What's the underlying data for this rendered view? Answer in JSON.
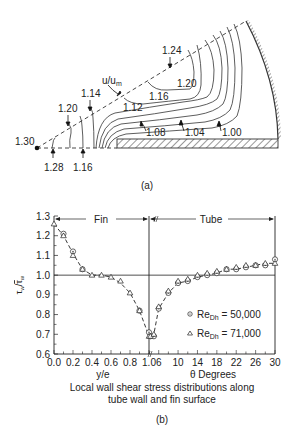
{
  "figure_a": {
    "caption": "(a)",
    "variable_label": "u/u",
    "variable_label_sub": "m",
    "contour_labels": {
      "c124": "1.24",
      "c120_top": "1.20",
      "c116_top": "1.16",
      "c112": "1.12",
      "c108": "1.08",
      "c104": "1.04",
      "c100": "1.00",
      "c130": "1.30",
      "c120_left": "1.20",
      "c114": "1.14",
      "c128": "1.28",
      "c116_bottom": "1.16"
    }
  },
  "figure_b": {
    "caption": "(b)",
    "description_line1": "Local wall shear stress distributions along",
    "description_line2": "tube wall and fin surface"
  },
  "chart_data": {
    "type": "scatter",
    "ylabel": "τw/τ̄w",
    "ylabel_main": "τ",
    "ylabel_sub": "w",
    "ylabel_sep": "/",
    "ylabel_bar": "τ",
    "ylabel_bar_sub": "w",
    "ylim": [
      0.6,
      1.3
    ],
    "yticks": [
      0.6,
      0.7,
      0.8,
      0.9,
      1.0,
      1.1,
      1.2,
      1.3
    ],
    "ytick_labels": [
      "0.6",
      "0.7",
      "0.8",
      "0.9",
      "1.0",
      "1.1",
      "1.2",
      "1.3"
    ],
    "reference_line": 1.0,
    "regions": {
      "fin": {
        "label": "Fin",
        "xlabel": "y/e",
        "xlim": [
          0.0,
          1.0
        ],
        "xticks": [
          0.0,
          0.2,
          0.4,
          0.6,
          0.8,
          1.0
        ],
        "xtick_labels": [
          "0.0",
          "0.2",
          "0.4",
          "0.6",
          "0.8",
          "1.0"
        ],
        "minor_step": 0.1
      },
      "tube": {
        "label": "Tube",
        "xlabel": "θ Degrees",
        "xlim": [
          4,
          30
        ],
        "xticks": [
          6,
          10,
          14,
          18,
          22,
          26,
          30
        ],
        "xtick_labels": [
          "6",
          "10",
          "14",
          "18",
          "22",
          "26",
          "30"
        ],
        "minor_step": 2
      }
    },
    "series": [
      {
        "name": "ReDh = 50,000",
        "name_main": "Re",
        "name_sub": "Dh",
        "name_value": " = 50,000",
        "marker": "circle-dot",
        "fin": {
          "x": [
            0.1,
            0.2,
            0.3,
            0.9,
            1.0
          ],
          "y": [
            1.21,
            1.12,
            1.03,
            0.82,
            0.71
          ]
        },
        "tube": {
          "x": [
            4.3,
            5,
            6,
            8,
            10,
            12,
            14,
            16,
            18,
            20,
            22,
            24,
            26,
            28,
            30
          ],
          "y": [
            0.69,
            0.69,
            0.83,
            0.91,
            0.96,
            0.97,
            0.99,
            1.0,
            1.01,
            1.03,
            1.03,
            1.04,
            1.05,
            1.05,
            1.08
          ]
        }
      },
      {
        "name": "ReDh = 71,000",
        "name_main": "Re",
        "name_sub": "Dh",
        "name_value": " = 71,000",
        "marker": "triangle",
        "fin": {
          "x": [
            0.0,
            0.1,
            0.2,
            0.3,
            0.4,
            0.5,
            0.6,
            0.7,
            0.8,
            0.9,
            1.0
          ],
          "y": [
            1.26,
            1.2,
            1.1,
            1.03,
            1.0,
            1.0,
            0.99,
            0.97,
            0.91,
            0.82,
            0.69
          ]
        },
        "tube": {
          "x": [
            4.3,
            5,
            6,
            8,
            10,
            12,
            14,
            16,
            18,
            20,
            22,
            24,
            26,
            28,
            30
          ],
          "y": [
            0.69,
            0.7,
            0.84,
            0.92,
            0.97,
            0.98,
            1.0,
            1.01,
            1.02,
            1.03,
            1.04,
            1.05,
            1.05,
            1.06,
            1.06
          ]
        }
      }
    ],
    "trend": {
      "fin": {
        "x": [
          0.0,
          0.1,
          0.2,
          0.3,
          0.4,
          0.5,
          0.6,
          0.7,
          0.8,
          0.9,
          1.0
        ],
        "y": [
          1.26,
          1.2,
          1.11,
          1.03,
          1.0,
          1.0,
          0.99,
          0.96,
          0.91,
          0.82,
          0.69
        ]
      },
      "tube": {
        "x": [
          4.3,
          5,
          6,
          8,
          10,
          12,
          14,
          16,
          18,
          20,
          22,
          24,
          26,
          28,
          30
        ],
        "y": [
          0.69,
          0.7,
          0.83,
          0.91,
          0.96,
          0.97,
          0.99,
          1.0,
          1.01,
          1.03,
          1.03,
          1.04,
          1.05,
          1.06,
          1.06
        ]
      }
    },
    "legend": "lower-right",
    "grid": false
  }
}
